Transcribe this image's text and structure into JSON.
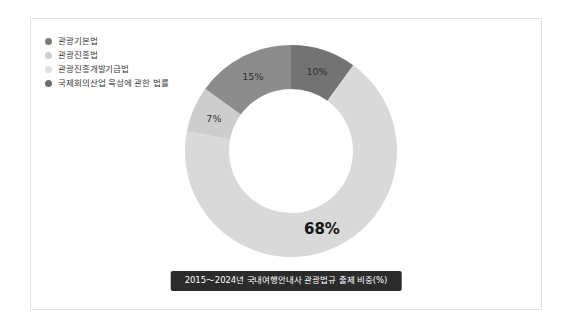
{
  "card": {
    "background": "#ffffff",
    "border_color": "#e2e2e2"
  },
  "legend": {
    "items": [
      {
        "label": "관광기본법",
        "color": "#7a7a7a",
        "marker": "circle-dot-icon"
      },
      {
        "label": "관광진흥법",
        "color": "#cfcfcf",
        "marker": "circle-dot-icon"
      },
      {
        "label": "관광진흥개발기금법",
        "color": "#dedede",
        "marker": "circle-dot-icon"
      },
      {
        "label": "국제회의산업 육성에 관한 법률",
        "color": "#6e6e6e",
        "marker": "circle-dot-icon"
      }
    ]
  },
  "caption": {
    "text": "2015～2024년 국내여행안내사 관광법규 출제 비중(%)",
    "background": "#2b2b2b",
    "color": "#ffffff"
  },
  "chart_data": {
    "type": "pie",
    "variant": "donut",
    "title": "2015～2024년 국내여행안내사 관광법규 출제 비중(%)",
    "unit": "%",
    "center": {
      "x": 108,
      "y": 108
    },
    "outer_radius": 106,
    "inner_radius": 62,
    "start_angle_deg": -90,
    "direction": "clockwise",
    "legend_position": "top-left",
    "grid": false,
    "labels": [
      "관광진흥법",
      "관광기본법",
      "국제회의산업 육성에 관한 법률",
      "관광진흥개발기금법"
    ],
    "values": [
      68,
      10,
      15,
      7
    ],
    "slices": [
      {
        "name": "관광기본법",
        "value": 10,
        "display": "10%",
        "color": "#737373",
        "label_radius": 84,
        "label_emphasis": false
      },
      {
        "name": "관광진흥법",
        "value": 68,
        "display": "68%",
        "color": "#d9d9d9",
        "label_radius": 84,
        "label_emphasis": true
      },
      {
        "name": "관광진흥개발기금법",
        "value": 7,
        "display": "7%",
        "color": "#cdcdcd",
        "label_radius": 84,
        "label_emphasis": false
      },
      {
        "name": "국제회의산업 육성에 관한 법률",
        "value": 15,
        "display": "15%",
        "color": "#8c8c8c",
        "label_radius": 84,
        "label_emphasis": false
      }
    ]
  }
}
